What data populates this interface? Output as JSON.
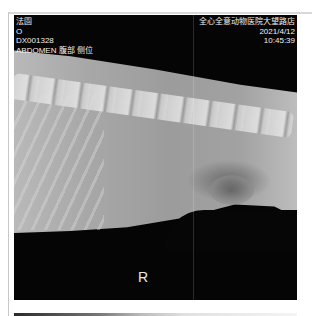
{
  "viewer": {
    "overlay_top_left": {
      "patient_name": "法園",
      "sex": "O",
      "study_id": "DX001328",
      "body_part_view": "ABDOMEN 腹部 侧位"
    },
    "overlay_top_right": {
      "institution": "全心全意动物医院大望路店",
      "date": "2021/4/12",
      "time": "10:45:39"
    },
    "orientation_marker": "R",
    "image_type": "lateral abdominal radiograph"
  },
  "colors": {
    "background": "#ffffff",
    "viewer_background": "#050505",
    "overlay_text": "#f0f0f0"
  }
}
